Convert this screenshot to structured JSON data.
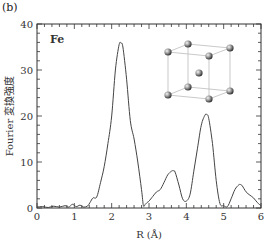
{
  "panel_label": "(b)",
  "chart_data": {
    "type": "line",
    "title": "",
    "annotation": "Fe",
    "xlabel": "R (Å)",
    "ylabel": "Fourier 変換強度",
    "xlim": [
      0,
      6
    ],
    "ylim": [
      0,
      40
    ],
    "xticks": [
      0,
      1,
      2,
      3,
      4,
      5,
      6
    ],
    "yticks": [
      0,
      10,
      20,
      30,
      40
    ],
    "grid": false,
    "inset": "bcc unit cell crystal structure (cube with 8 corner atoms and 1 body-center atom)",
    "series": [
      {
        "name": "Fe",
        "x": [
          0.0,
          0.15,
          0.3,
          0.45,
          0.6,
          0.75,
          0.85,
          0.95,
          1.05,
          1.15,
          1.25,
          1.35,
          1.42,
          1.5,
          1.6,
          1.7,
          1.8,
          1.9,
          2.0,
          2.1,
          2.2,
          2.25,
          2.3,
          2.4,
          2.5,
          2.6,
          2.7,
          2.8,
          2.85,
          2.9,
          2.95,
          3.0,
          3.1,
          3.2,
          3.3,
          3.4,
          3.5,
          3.6,
          3.65,
          3.7,
          3.8,
          3.9,
          4.0,
          4.1,
          4.2,
          4.3,
          4.4,
          4.5,
          4.55,
          4.6,
          4.7,
          4.8,
          4.9,
          5.0,
          5.1,
          5.2,
          5.3,
          5.4,
          5.45,
          5.5,
          5.6,
          5.7,
          5.8,
          5.9,
          6.0
        ],
        "y": [
          0.2,
          0.3,
          0.1,
          0.4,
          0.2,
          0.5,
          0.2,
          0.8,
          0.3,
          0.6,
          0.2,
          0.4,
          1.2,
          2.2,
          2.4,
          5.5,
          9,
          14,
          20,
          30,
          35.5,
          35.8,
          35,
          28,
          19,
          15,
          10,
          4,
          0.5,
          0.8,
          1.2,
          1.5,
          2.5,
          3.5,
          4,
          5.5,
          7.2,
          8,
          8.1,
          7.8,
          5,
          2,
          1.5,
          3,
          8,
          13,
          18,
          20.2,
          20.3,
          19.5,
          14,
          6,
          1,
          0.5,
          0.3,
          2,
          4,
          5,
          5.1,
          4.8,
          3.5,
          2.8,
          2.2,
          1.2,
          0.5
        ]
      }
    ]
  }
}
